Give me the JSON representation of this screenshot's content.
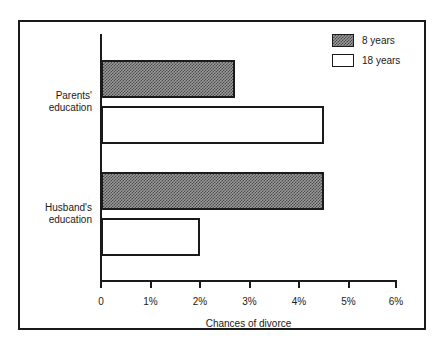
{
  "chart_data": {
    "type": "bar",
    "orientation": "horizontal",
    "title": "",
    "xlabel": "Chances of divorce",
    "ylabel": "",
    "categories": [
      "Parents' education",
      "Husband's education"
    ],
    "series": [
      {
        "name": "8 years",
        "values": [
          2.7,
          4.5
        ],
        "fill": "hatch"
      },
      {
        "name": "18 years",
        "values": [
          4.5,
          2.0
        ],
        "fill": "white"
      }
    ],
    "xlim": [
      0,
      6
    ],
    "xticks": [
      0,
      1,
      2,
      3,
      4,
      5,
      6
    ],
    "xtick_labels": [
      "0",
      "1%",
      "2%",
      "3%",
      "4%",
      "5%",
      "6%"
    ],
    "grid": false,
    "legend_position": "top-right",
    "colors": {
      "axis": "#1a1a1a",
      "bar_outline": "#1a1a1a",
      "hatch_fill": "#4a4a4a",
      "white_fill": "#ffffff",
      "background": "#ffffff"
    }
  },
  "legend": {
    "entries": [
      {
        "label": "8 years"
      },
      {
        "label": "18 years"
      }
    ]
  },
  "axis": {
    "x_title": "Chances of divorce",
    "tick_labels": [
      "0",
      "1%",
      "2%",
      "3%",
      "4%",
      "5%",
      "6%"
    ]
  },
  "categories": [
    {
      "label": "Parents'\neducation"
    },
    {
      "label": "Husband's\neducation"
    }
  ]
}
